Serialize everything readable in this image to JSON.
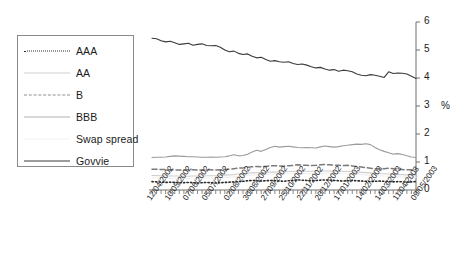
{
  "chart_data": {
    "type": "line",
    "title": "",
    "xlabel": "",
    "ylabel": "%",
    "ylim": [
      0,
      6
    ],
    "yticks": [
      0,
      1,
      2,
      3,
      4,
      5,
      6
    ],
    "grid": false,
    "legend_position": "left-outside",
    "x_tick_labels": [
      "12/04/2002",
      "10/05/2002",
      "07/06/2002",
      "05/07/2002",
      "02/08/2002",
      "30/08/2002",
      "27/09/2002",
      "25/10/2002",
      "22/11/2002",
      "20/12/2002",
      "17/01/2003",
      "14/02/2003",
      "14/03/2003",
      "11/04/2003",
      "09/05/2003"
    ],
    "x_label_rotation": -55,
    "series": [
      {
        "name": "AAA",
        "style": "dotted",
        "color": "#2b2b2b",
        "values": [
          0.3,
          0.29,
          0.28,
          0.27,
          0.28,
          0.27,
          0.26,
          0.26,
          0.27,
          0.26,
          0.25,
          0.26,
          0.27,
          0.26,
          0.25,
          0.26,
          0.27,
          0.28,
          0.29,
          0.3,
          0.31,
          0.33,
          0.34,
          0.33,
          0.32,
          0.33,
          0.34,
          0.33,
          0.32,
          0.31,
          0.33,
          0.34,
          0.36,
          0.35,
          0.34,
          0.33,
          0.34,
          0.35,
          0.36,
          0.35,
          0.34,
          0.33,
          0.32,
          0.33,
          0.34,
          0.33,
          0.32,
          0.31,
          0.3,
          0.31,
          0.32,
          0.31,
          0.3,
          0.29,
          0.3,
          0.29,
          0.28,
          0.29,
          0.3
        ]
      },
      {
        "name": "AA",
        "style": "solid",
        "color": "#cfcfcf",
        "values": [
          0.52,
          0.52,
          0.51,
          0.51,
          0.5,
          0.5,
          0.5,
          0.49,
          0.49,
          0.5,
          0.5,
          0.5,
          0.51,
          0.51,
          0.51,
          0.52,
          0.53,
          0.54,
          0.55,
          0.57,
          0.58,
          0.6,
          0.61,
          0.62,
          0.62,
          0.63,
          0.64,
          0.64,
          0.65,
          0.65,
          0.66,
          0.66,
          0.67,
          0.67,
          0.67,
          0.67,
          0.68,
          0.68,
          0.68,
          0.68,
          0.67,
          0.67,
          0.66,
          0.66,
          0.65,
          0.64,
          0.63,
          0.62,
          0.61,
          0.6,
          0.59,
          0.58,
          0.57,
          0.56,
          0.55,
          0.55,
          0.54,
          0.54,
          0.54
        ]
      },
      {
        "name": "B",
        "style": "dashed",
        "color": "#7a7a7a",
        "values": [
          0.74,
          0.74,
          0.73,
          0.73,
          0.72,
          0.72,
          0.71,
          0.71,
          0.72,
          0.72,
          0.71,
          0.71,
          0.72,
          0.72,
          0.71,
          0.72,
          0.73,
          0.74,
          0.76,
          0.78,
          0.79,
          0.81,
          0.83,
          0.84,
          0.83,
          0.84,
          0.86,
          0.87,
          0.86,
          0.85,
          0.87,
          0.88,
          0.9,
          0.89,
          0.88,
          0.87,
          0.88,
          0.9,
          0.91,
          0.9,
          0.89,
          0.88,
          0.87,
          0.88,
          0.86,
          0.84,
          0.82,
          0.8,
          0.78,
          0.76,
          0.74,
          0.76,
          0.78,
          0.76,
          0.74,
          0.73,
          0.72,
          0.72,
          0.73
        ]
      },
      {
        "name": "BBB",
        "style": "solid",
        "color": "#9b9b9b",
        "values": [
          1.16,
          1.17,
          1.17,
          1.18,
          1.2,
          1.22,
          1.21,
          1.2,
          1.19,
          1.19,
          1.18,
          1.17,
          1.17,
          1.18,
          1.17,
          1.18,
          1.19,
          1.22,
          1.26,
          1.22,
          1.23,
          1.28,
          1.36,
          1.42,
          1.38,
          1.45,
          1.52,
          1.56,
          1.53,
          1.55,
          1.56,
          1.54,
          1.52,
          1.51,
          1.52,
          1.51,
          1.5,
          1.54,
          1.57,
          1.55,
          1.53,
          1.55,
          1.58,
          1.6,
          1.62,
          1.64,
          1.63,
          1.65,
          1.62,
          1.52,
          1.44,
          1.38,
          1.33,
          1.28,
          1.3,
          1.27,
          1.22,
          1.18,
          1.16
        ]
      },
      {
        "name": "Swap spread",
        "style": "solid",
        "color": "#efefef",
        "values": [
          0.44,
          0.44,
          0.43,
          0.43,
          0.42,
          0.42,
          0.42,
          0.41,
          0.41,
          0.42,
          0.42,
          0.42,
          0.43,
          0.43,
          0.43,
          0.44,
          0.45,
          0.46,
          0.47,
          0.49,
          0.5,
          0.52,
          0.53,
          0.54,
          0.54,
          0.55,
          0.56,
          0.56,
          0.57,
          0.57,
          0.58,
          0.58,
          0.59,
          0.59,
          0.59,
          0.59,
          0.6,
          0.6,
          0.6,
          0.6,
          0.59,
          0.59,
          0.58,
          0.58,
          0.57,
          0.56,
          0.55,
          0.54,
          0.53,
          0.52,
          0.51,
          0.5,
          0.49,
          0.48,
          0.47,
          0.47,
          0.46,
          0.46,
          0.46
        ]
      },
      {
        "name": "Govvie",
        "style": "solid",
        "color": "#3a3a3a",
        "values": [
          5.42,
          5.4,
          5.33,
          5.29,
          5.31,
          5.26,
          5.2,
          5.22,
          5.24,
          5.17,
          5.2,
          5.22,
          5.16,
          5.15,
          5.16,
          5.1,
          5.0,
          4.94,
          4.96,
          4.88,
          4.84,
          4.86,
          4.78,
          4.72,
          4.74,
          4.66,
          4.6,
          4.62,
          4.58,
          4.56,
          4.58,
          4.52,
          4.48,
          4.5,
          4.46,
          4.4,
          4.36,
          4.38,
          4.32,
          4.28,
          4.3,
          4.24,
          4.28,
          4.26,
          4.22,
          4.14,
          4.1,
          4.08,
          4.12,
          4.1,
          4.06,
          4.02,
          4.22,
          4.16,
          4.18,
          4.17,
          4.14,
          4.06,
          3.98
        ]
      }
    ]
  },
  "legend": {
    "items": [
      {
        "label": "AAA"
      },
      {
        "label": "AA"
      },
      {
        "label": "B"
      },
      {
        "label": "BBB"
      },
      {
        "label": "Swap spread"
      },
      {
        "label": "Govvie"
      }
    ]
  },
  "axis": {
    "y_unit": "%"
  }
}
